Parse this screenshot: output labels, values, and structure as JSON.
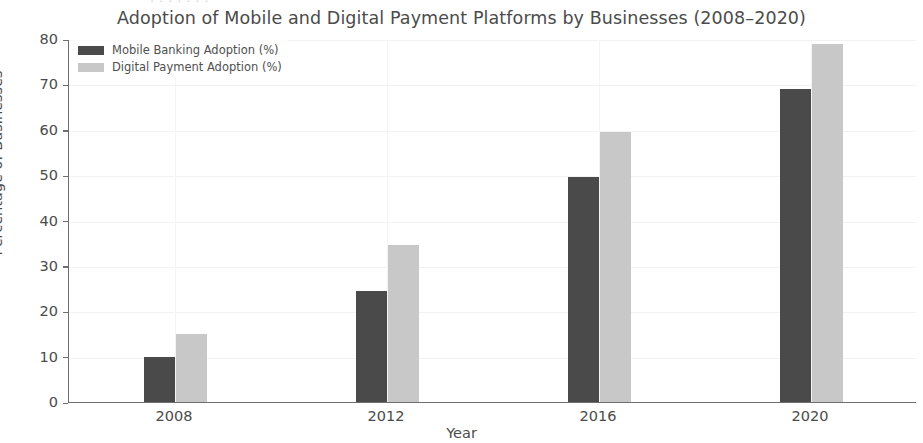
{
  "chart_data": {
    "type": "bar",
    "title": "Adoption of Mobile and Digital Payment Platforms by Businesses (2008–2020)",
    "xlabel": "Year",
    "ylabel": "Percentage of Businesses",
    "categories": [
      "2008",
      "2012",
      "2016",
      "2020"
    ],
    "series": [
      {
        "name": "Mobile Banking Adoption (%)",
        "color": "#4a4a4a",
        "values": [
          10,
          24.5,
          49.5,
          69
        ]
      },
      {
        "name": "Digital Payment Adoption (%)",
        "color": "#c8c8c8",
        "values": [
          15,
          34.5,
          59.5,
          79
        ]
      }
    ],
    "ylim": [
      0,
      80
    ],
    "yticks": [
      0,
      10,
      20,
      30,
      40,
      50,
      60,
      70,
      80
    ],
    "ytick_labels": [
      "0",
      "10",
      "20",
      "30",
      "40",
      "50",
      "60",
      "70",
      "80"
    ],
    "grid": true,
    "legend_position": "upper left"
  },
  "artifact": {
    "top_fragment": "· · · · · · ·"
  }
}
